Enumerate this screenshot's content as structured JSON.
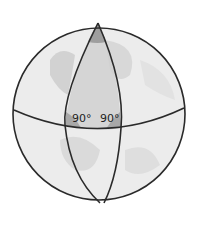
{
  "diagram": {
    "labels": {
      "left_angle": "90°",
      "right_angle": "90°"
    },
    "colors": {
      "outline": "#2a2a2a",
      "globe_fill": "#ebebeb",
      "land": "#d4d4d4",
      "triangle_shade": "#bdbdbd",
      "corner_shade": "#9a9a9a"
    }
  }
}
